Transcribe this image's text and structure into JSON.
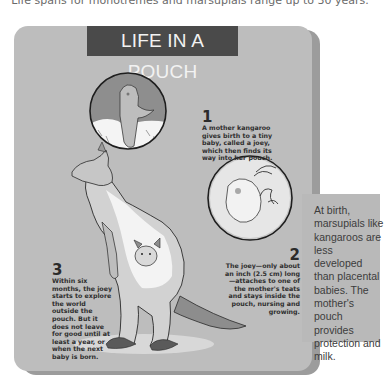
{
  "caption": {
    "top_line": "Life spans for monotremes and marsupials range up to 30 years."
  },
  "infographic": {
    "title": "LIFE IN A POUCH",
    "steps": [
      {
        "number": "1",
        "text": "A mother kangaroo gives birth to a tiny baby, called a joey, which then finds its way into her pouch."
      },
      {
        "number": "2",
        "text": "The joey—only about an inch (2.5 cm) long—attaches to one of the mother's teats and stays inside the pouch, nursing and growing."
      },
      {
        "number": "3",
        "text": "Within six months, the joey starts to explore the world outside the pouch. But it does not leave for good until at least a year, or when the next baby is born."
      }
    ],
    "illustrations": [
      "newborn-joey-in-fur-circle",
      "joey-attached-to-teat-circle",
      "kangaroo-with-joey-in-pouch"
    ]
  },
  "sidebar": {
    "text": "At birth, marsupials like kangaroos are less developed than placental babies. The mother's pouch provides protection and milk."
  },
  "colors": {
    "panel": "#bdbdbd",
    "title_bg": "#4a4a4a",
    "title_text": "#f2f2f2",
    "body_text": "#2e2e2e",
    "sidebar_bg": "#b9b9b9"
  }
}
